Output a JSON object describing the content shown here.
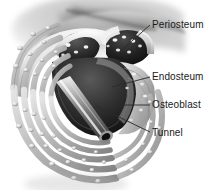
{
  "figure": {
    "background_color": "#ffffff",
    "style": "grayscale medical illustration",
    "label_color": "#1a1a1a",
    "leader_color": "#2a2a2a"
  },
  "labels": {
    "periosteum": "Periosteum",
    "endosteum": "Endosteum",
    "osteoblast": "Osteoblast",
    "tunnel": "Tunnel"
  },
  "leaders": [
    {
      "name": "periosteum",
      "x1": 150,
      "y1": 25,
      "x2": 124,
      "y2": 48
    },
    {
      "name": "endosteum",
      "x1": 150,
      "y1": 77,
      "x2": 112,
      "y2": 87
    },
    {
      "name": "osteoblast",
      "x1": 150,
      "y1": 105,
      "x2": 119,
      "y2": 105
    },
    {
      "name": "tunnel",
      "x1": 150,
      "y1": 132,
      "x2": 96,
      "y2": 106
    }
  ],
  "anatomy": {
    "lamellae_rings": 6,
    "osteoblast_cell_rows": 6,
    "cavity_label": "resorption cavity",
    "tunnel_description": "cylindrical vascular tunnel entering cavity",
    "periosteum_description": "dark marrow-like spaces with bright cells at top"
  },
  "colors": {
    "bone_light": "#d9d9d9",
    "bone_mid": "#a8a8a8",
    "bone_dark": "#6e6e6e",
    "cavity_dark": "#2b2b2b",
    "cavity_black": "#121212",
    "highlight": "#f2f2f2",
    "tunnel_light": "#cfcfcf"
  }
}
